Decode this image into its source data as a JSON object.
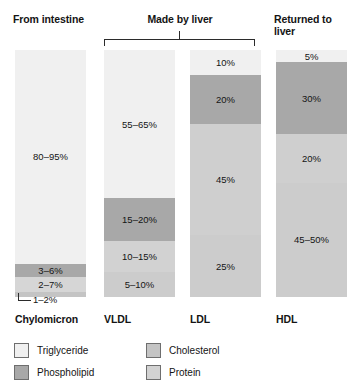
{
  "groups": {
    "intestine": "From intestine",
    "liver": "Made by liver",
    "returned": "Returned to\nliver"
  },
  "colors": {
    "triglyceride": "#f0f0f0",
    "phospholipid": "#a8a8a8",
    "cholesterol": "#c4c4c4",
    "protein": "#d2d2d2",
    "outline": "#6e6e6e",
    "text": "#141414",
    "leader": "#2b2b2b"
  },
  "legend": {
    "items": [
      {
        "label": "Triglyceride",
        "color": "#f0f0f0"
      },
      {
        "label": "Phospholipid",
        "color": "#a8a8a8"
      },
      {
        "label": "Cholesterol",
        "color": "#c4c4c4"
      },
      {
        "label": "Protein",
        "color": "#d2d2d2"
      }
    ]
  },
  "callout": {
    "label": "1–2%"
  },
  "chart_data": {
    "type": "bar",
    "title": "",
    "subtype": "stacked-composition",
    "xlabel": "",
    "ylabel": "",
    "ylim": [
      0,
      100
    ],
    "grid": false,
    "legend_position": "bottom-left",
    "categories": [
      "Chylomicron",
      "VLDL",
      "LDL",
      "HDL"
    ],
    "series": [
      {
        "name": "Triglyceride",
        "color": "#f0f0f0"
      },
      {
        "name": "Phospholipid",
        "color": "#a8a8a8"
      },
      {
        "name": "Cholesterol",
        "color": "#c4c4c4"
      },
      {
        "name": "Protein",
        "color": "#d2d2d2"
      }
    ],
    "columns": [
      {
        "name": "Chylomicron",
        "group": "From intestine",
        "segments": [
          {
            "component": "Triglyceride",
            "label": "80–95%",
            "color": "#f0f0f0",
            "height_pct": 85.0,
            "label_inside": true
          },
          {
            "component": "Phospholipid",
            "label": "3–6%",
            "color": "#a8a8a8",
            "height_pct": 5.5,
            "label_inside": true
          },
          {
            "component": "Cholesterol",
            "label": "2–7%",
            "color": "#d6d6d6",
            "height_pct": 6.0,
            "label_inside": true
          },
          {
            "component": "Protein",
            "label": "1–2%",
            "color": "#c4c4c4",
            "height_pct": 1.8,
            "label_inside": false
          }
        ]
      },
      {
        "name": "VLDL",
        "group": "Made by liver",
        "segments": [
          {
            "component": "Triglyceride",
            "label": "55–65%",
            "color": "#f0f0f0",
            "height_pct": 60.0,
            "label_inside": true
          },
          {
            "component": "Phospholipid",
            "label": "15–20%",
            "color": "#a8a8a8",
            "height_pct": 17.5,
            "label_inside": true
          },
          {
            "component": "Cholesterol",
            "label": "10–15%",
            "color": "#d2d2d2",
            "height_pct": 12.5,
            "label_inside": true
          },
          {
            "component": "Protein",
            "label": "5–10%",
            "color": "#cccccc",
            "height_pct": 10.0,
            "label_inside": true
          }
        ]
      },
      {
        "name": "LDL",
        "group": "Made by liver",
        "segments": [
          {
            "component": "Triglyceride",
            "label": "10%",
            "color": "#f0f0f0",
            "height_pct": 10.0,
            "label_inside": true
          },
          {
            "component": "Phospholipid",
            "label": "20%",
            "color": "#a8a8a8",
            "height_pct": 20.0,
            "label_inside": true
          },
          {
            "component": "Cholesterol",
            "label": "45%",
            "color": "#cfcfcf",
            "height_pct": 45.0,
            "label_inside": true
          },
          {
            "component": "Protein",
            "label": "25%",
            "color": "#cccccc",
            "height_pct": 25.0,
            "label_inside": true
          }
        ]
      },
      {
        "name": "HDL",
        "group": "Returned to liver",
        "segments": [
          {
            "component": "Triglyceride",
            "label": "5%",
            "color": "#f0f0f0",
            "height_pct": 5.0,
            "label_inside": true
          },
          {
            "component": "Phospholipid",
            "label": "30%",
            "color": "#a8a8a8",
            "height_pct": 30.0,
            "label_inside": true
          },
          {
            "component": "Cholesterol",
            "label": "20%",
            "color": "#cfcfcf",
            "height_pct": 20.0,
            "label_inside": true
          },
          {
            "component": "Protein",
            "label": "45–50%",
            "color": "#cccccc",
            "height_pct": 47.5,
            "label_inside": true
          }
        ]
      }
    ]
  }
}
